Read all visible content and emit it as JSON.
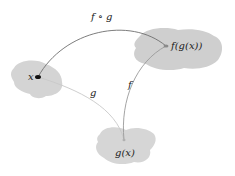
{
  "diagram": {
    "nodes": [
      {
        "id": "x",
        "label": "x",
        "set_color": "#d4d4d4"
      },
      {
        "id": "fgx",
        "label": "f(g(x))",
        "set_color": "#cfcfcf"
      },
      {
        "id": "gx",
        "label": "g(x)",
        "set_color": "#d6d6d6"
      }
    ],
    "edges": [
      {
        "from": "x",
        "to": "fgx",
        "label": "f ∘ g",
        "color": "#6e6e6e"
      },
      {
        "from": "x",
        "to": "gx",
        "label": "g",
        "color": "#c8c8c8"
      },
      {
        "from": "gx",
        "to": "fgx",
        "label": "f",
        "color": "#9a9a9a"
      }
    ]
  }
}
